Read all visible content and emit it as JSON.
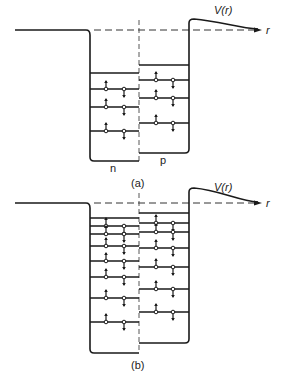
{
  "figure": {
    "panels": [
      {
        "id": "a",
        "caption": "(a)",
        "potential_label": "V(r)",
        "axis_label": "r",
        "well_labels": {
          "left": "n",
          "right": "p"
        },
        "baseline_y": 30,
        "barrier_top_y": 19,
        "n_well": {
          "bottom_y": 161,
          "empty_level_y": 73,
          "filled_levels_y": [
            89,
            107,
            131
          ]
        },
        "p_well": {
          "bottom_y": 153,
          "empty_level_y": 65,
          "filled_levels_y": [
            80,
            98,
            123
          ]
        }
      },
      {
        "id": "b",
        "caption": "(b)",
        "potential_label": "V(r)",
        "axis_label": "r",
        "baseline_y": 203,
        "barrier_top_y": 188,
        "n_well": {
          "bottom_y": 353,
          "empty_level_y": 218,
          "filled_levels_y": [
            226,
            234,
            246,
            261,
            277,
            298,
            322
          ]
        },
        "p_well": {
          "bottom_y": 343,
          "empty_level_y": 213,
          "filled_levels_y": [
            223,
            232,
            248,
            267,
            289,
            312
          ]
        }
      }
    ],
    "colors": {
      "ink": "#1a1a1a",
      "background": "#ffffff"
    }
  }
}
